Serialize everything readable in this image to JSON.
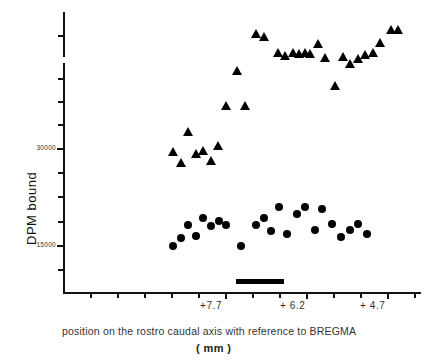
{
  "chart_data": {
    "type": "scatter",
    "title": "",
    "xlabel": "position on the rostro caudal axis with reference to BREGMA (mm)",
    "ylabel": "DPM bound",
    "grid": false,
    "legend": "none",
    "axis_break_y": true,
    "xlim": [
      8.8,
      4.0
    ],
    "ylim": [
      0,
      62000
    ],
    "xticklabels": [
      "+7.7",
      "+6.2",
      "+4.7"
    ],
    "xtickvalues": [
      7.7,
      6.2,
      4.7
    ],
    "yticklabels": [
      "30000",
      "15000"
    ],
    "ytickvalues": [
      30000,
      15000
    ],
    "series": [
      {
        "name": "triangles",
        "marker": "triangle",
        "color": "#000000",
        "points": [
          {
            "x": 8.66,
            "y": 29600
          },
          {
            "x": 8.52,
            "y": 27800
          },
          {
            "x": 8.38,
            "y": 32600
          },
          {
            "x": 8.24,
            "y": 29200
          },
          {
            "x": 8.1,
            "y": 29700
          },
          {
            "x": 7.96,
            "y": 28200
          },
          {
            "x": 7.82,
            "y": 30400
          },
          {
            "x": 7.68,
            "y": 36600
          },
          {
            "x": 7.47,
            "y": 42000
          },
          {
            "x": 7.33,
            "y": 36600
          },
          {
            "x": 7.12,
            "y": 53400
          },
          {
            "x": 6.98,
            "y": 52400
          },
          {
            "x": 6.72,
            "y": 46200
          },
          {
            "x": 6.58,
            "y": 45300
          },
          {
            "x": 6.44,
            "y": 46200
          },
          {
            "x": 6.32,
            "y": 46100
          },
          {
            "x": 6.22,
            "y": 46200
          },
          {
            "x": 6.12,
            "y": 46000
          },
          {
            "x": 5.98,
            "y": 49600
          },
          {
            "x": 5.84,
            "y": 44700
          },
          {
            "x": 5.66,
            "y": 39800
          },
          {
            "x": 5.52,
            "y": 45000
          },
          {
            "x": 5.38,
            "y": 43200
          },
          {
            "x": 5.24,
            "y": 44200
          },
          {
            "x": 5.1,
            "y": 45800
          },
          {
            "x": 4.96,
            "y": 46500
          },
          {
            "x": 4.82,
            "y": 50000
          },
          {
            "x": 4.62,
            "y": 54800
          },
          {
            "x": 4.5,
            "y": 55000
          }
        ]
      },
      {
        "name": "circles",
        "marker": "circle",
        "color": "#000000",
        "points": [
          {
            "x": 8.66,
            "y": 15000
          },
          {
            "x": 8.52,
            "y": 16300
          },
          {
            "x": 8.38,
            "y": 18200
          },
          {
            "x": 8.24,
            "y": 16500
          },
          {
            "x": 8.1,
            "y": 19300
          },
          {
            "x": 7.96,
            "y": 18100
          },
          {
            "x": 7.82,
            "y": 18800
          },
          {
            "x": 7.68,
            "y": 18200
          },
          {
            "x": 7.4,
            "y": 15000
          },
          {
            "x": 7.12,
            "y": 18200
          },
          {
            "x": 6.98,
            "y": 19400
          },
          {
            "x": 6.84,
            "y": 17300
          },
          {
            "x": 6.7,
            "y": 21000
          },
          {
            "x": 6.56,
            "y": 16900
          },
          {
            "x": 6.36,
            "y": 19900
          },
          {
            "x": 6.22,
            "y": 21000
          },
          {
            "x": 6.04,
            "y": 17500
          },
          {
            "x": 5.9,
            "y": 20800
          },
          {
            "x": 5.72,
            "y": 18400
          },
          {
            "x": 5.56,
            "y": 16400
          },
          {
            "x": 5.38,
            "y": 17500
          },
          {
            "x": 5.24,
            "y": 18400
          },
          {
            "x": 5.08,
            "y": 16900
          }
        ]
      }
    ],
    "region_marker": {
      "label": "",
      "x_start": 6.85,
      "x_end": 6.05
    }
  },
  "axis": {
    "y_title": "DPM  bound",
    "y_labels": [
      "30000",
      "15000"
    ],
    "x_labels": [
      "+7.7",
      "+ 6.2",
      "+ 4.7"
    ]
  },
  "caption": {
    "line1": "position on the rostro caudal axis with reference to BREGMA",
    "line2": "( mm )"
  }
}
